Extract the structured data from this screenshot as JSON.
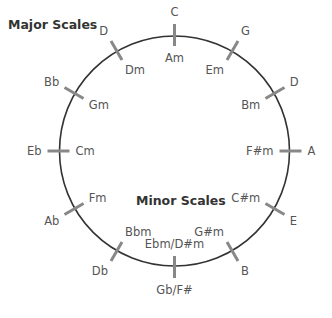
{
  "diagram": {
    "title_major": "Major Scales",
    "title_minor": "Minor Scales",
    "colors": {
      "circle": "#333333",
      "tick": "#888888",
      "label": "#555555",
      "title": "#333333"
    },
    "circle": {
      "cx": 174.5,
      "cy": 151,
      "r": 115
    },
    "keys": [
      {
        "angle": 0,
        "major": "C",
        "minor": "Am"
      },
      {
        "angle": 30,
        "major": "G",
        "minor": "Em"
      },
      {
        "angle": 60,
        "major": "D",
        "minor": "Bm"
      },
      {
        "angle": 90,
        "major": "A",
        "minor": "F#m"
      },
      {
        "angle": 120,
        "major": "E",
        "minor": "C#m"
      },
      {
        "angle": 150,
        "major": "B",
        "minor": "G#m"
      },
      {
        "angle": 180,
        "major": "Gb/F#",
        "minor": "Ebm/D#m"
      },
      {
        "angle": 210,
        "major": "Db",
        "minor": "Bbm"
      },
      {
        "angle": 240,
        "major": "Ab",
        "minor": "Fm"
      },
      {
        "angle": 270,
        "major": "Eb",
        "minor": "Cm"
      },
      {
        "angle": 300,
        "major": "Bb",
        "minor": "Gm"
      },
      {
        "angle": 330,
        "major": "D",
        "minor": "Dm"
      }
    ]
  }
}
